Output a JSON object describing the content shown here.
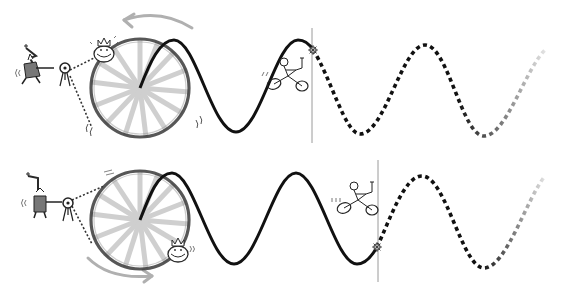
{
  "canvas": {
    "width": 570,
    "height": 296,
    "background": "#ffffff"
  },
  "colors": {
    "wave": "#111111",
    "wheel_rim": "#3a3a3a",
    "spoke": "#9a9a9a",
    "guide_line": "#8c8c8c",
    "guide_line_light": "#c8c8c8",
    "arrow": "#a8a8a8",
    "figure": "#2a2a2a",
    "dotted_ray": "#333333"
  },
  "panels": [
    {
      "id": "top",
      "wheel": {
        "cx": 140,
        "cy": 88,
        "r": 50,
        "spokes": 16
      },
      "guide_lines": [
        {
          "y": 49,
          "x1": 60,
          "x2": 560
        },
        {
          "y": 88,
          "x1": 120,
          "x2": 560
        }
      ],
      "vertical_marker": {
        "x": 312,
        "y1": 28,
        "y2": 143
      },
      "rotation_arrow": {
        "direction": "counter-clockwise",
        "position": "top"
      },
      "rider_on_rim": {
        "angle_deg": 130,
        "x": 104,
        "y": 52
      },
      "cyclist": {
        "x": 288,
        "y": 72
      },
      "marker_star": {
        "x": 313,
        "y": 50
      },
      "wave": {
        "solid_points": [
          [
            140,
            88
          ],
          [
            174,
            40
          ],
          [
            236,
            132
          ],
          [
            298,
            40
          ],
          [
            313,
            50
          ]
        ],
        "dashed_points": [
          [
            313,
            50
          ],
          [
            360,
            134
          ],
          [
            425,
            45
          ],
          [
            484,
            136
          ],
          [
            545,
            50
          ]
        ]
      }
    },
    {
      "id": "bottom",
      "wheel": {
        "cx": 140,
        "cy": 220,
        "r": 50,
        "spokes": 16
      },
      "guide_lines": [
        {
          "y": 220,
          "x1": 120,
          "x2": 560
        },
        {
          "y": 246,
          "x1": 22,
          "x2": 545
        }
      ],
      "vertical_marker": {
        "x": 378,
        "y1": 160,
        "y2": 282
      },
      "rotation_arrow": {
        "direction": "counter-clockwise",
        "position": "bottom"
      },
      "rider_on_rim": {
        "angle_deg": -40,
        "x": 179,
        "y": 250
      },
      "cyclist": {
        "x": 356,
        "y": 198
      },
      "marker_star": {
        "x": 377,
        "y": 247
      },
      "wave": {
        "solid_points": [
          [
            140,
            220
          ],
          [
            172,
            173
          ],
          [
            234,
            264
          ],
          [
            296,
            173
          ],
          [
            357,
            264
          ],
          [
            377,
            247
          ]
        ],
        "dashed_points": [
          [
            377,
            247
          ],
          [
            422,
            176
          ],
          [
            484,
            268
          ],
          [
            545,
            176
          ]
        ]
      }
    }
  ],
  "characters": {
    "wizard_top": {
      "x": 28,
      "y": 68,
      "icon": "wizard-icon"
    },
    "wizard_bottom": {
      "x": 40,
      "y": 200,
      "icon": "wizard-icon"
    },
    "projector_top": {
      "x": 64,
      "y": 68,
      "icon": "projector-tripod-icon"
    },
    "projector_bottom": {
      "x": 68,
      "y": 200,
      "icon": "projector-tripod-icon"
    }
  }
}
